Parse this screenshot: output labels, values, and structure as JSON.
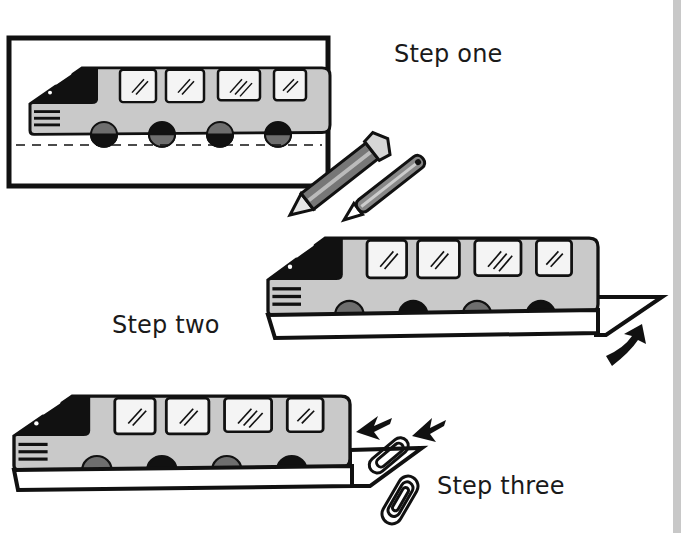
{
  "steps": [
    {
      "label": "Step one",
      "description": "Bus drawn on card inside frame, with pencils"
    },
    {
      "label": "Step two",
      "description": "Bus cut out with tab folded at back"
    },
    {
      "label": "Step three",
      "description": "Bus with paper clips attached at back tab"
    }
  ],
  "icons": {
    "pencil": "pencil-icon",
    "fold_arrow": "curved-arrow-icon",
    "clip_arrows": "arrow-icon",
    "paper_clip": "paper-clip-icon"
  },
  "colors": {
    "outline": "#111111",
    "bus_body": "#c9c9c9",
    "wheel_dark": "#1a1a1a",
    "wheel_grey": "#6e6e6e",
    "window": "#f4f4f4",
    "strip": "#c8c8c8"
  }
}
